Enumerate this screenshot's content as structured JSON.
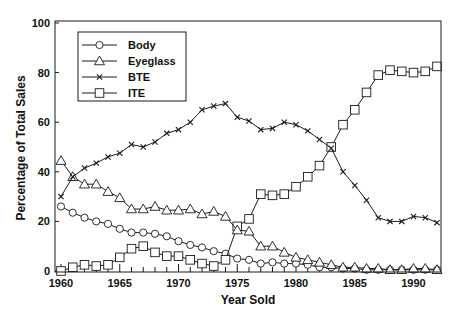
{
  "chart_data": {
    "type": "line",
    "title": "",
    "xlabel": "Year Sold",
    "ylabel": "Percentage of Total Sales",
    "xlim": [
      1960,
      1992
    ],
    "ylim": [
      0,
      100
    ],
    "x_ticks": [
      1960,
      1965,
      1970,
      1975,
      1980,
      1985,
      1990
    ],
    "y_ticks": [
      0,
      20,
      40,
      60,
      80,
      100
    ],
    "grid": false,
    "legend_position": "upper left",
    "x": [
      1960,
      1961,
      1962,
      1963,
      1964,
      1965,
      1966,
      1967,
      1968,
      1969,
      1970,
      1971,
      1972,
      1973,
      1974,
      1975,
      1976,
      1977,
      1978,
      1979,
      1980,
      1981,
      1982,
      1983,
      1984,
      1985,
      1986,
      1987,
      1988,
      1989,
      1990,
      1991,
      1992
    ],
    "series": [
      {
        "name": "Body",
        "marker": "circle",
        "values": [
          26,
          23.5,
          21.5,
          20,
          19,
          17,
          15.5,
          15.5,
          15,
          14,
          12,
          10.5,
          9.5,
          8,
          7,
          5,
          4.5,
          3,
          3.5,
          3,
          3,
          2.5,
          1.5,
          1.5,
          1,
          1,
          0.5,
          0.5,
          0.5,
          0.5,
          0.5,
          0.5,
          0.5
        ]
      },
      {
        "name": "Eyeglass",
        "marker": "triangle",
        "values": [
          44.5,
          38,
          35,
          35,
          32,
          29.5,
          25,
          25,
          26,
          24.5,
          24.5,
          25,
          23,
          24,
          22,
          16.5,
          16,
          10,
          10,
          7.5,
          5.5,
          4.5,
          3.5,
          2.5,
          1.5,
          1.5,
          1,
          1,
          0.5,
          0.5,
          1,
          1,
          0.5
        ]
      },
      {
        "name": "BTE",
        "marker": "x",
        "values": [
          30,
          38,
          41.5,
          43.5,
          46,
          47.5,
          51,
          50,
          52,
          55.5,
          57,
          60,
          65,
          66.5,
          67.5,
          62,
          60.5,
          57,
          57.5,
          60,
          59,
          56.5,
          53,
          49.5,
          40,
          34.5,
          28.5,
          21.5,
          20,
          20,
          22,
          21.5,
          19.5
        ]
      },
      {
        "name": "ITE",
        "marker": "square",
        "values": [
          0,
          1.5,
          2.5,
          2,
          2.5,
          5.5,
          9,
          10,
          7.5,
          6,
          6,
          4.5,
          3,
          2,
          4.5,
          18,
          21,
          31,
          30.5,
          31,
          34,
          38,
          42.5,
          50,
          59,
          65,
          72,
          79,
          81,
          80.5,
          80,
          80.5,
          82.5
        ]
      }
    ]
  },
  "colors": {
    "line": "#1a1a1a",
    "background": "#ffffff"
  }
}
